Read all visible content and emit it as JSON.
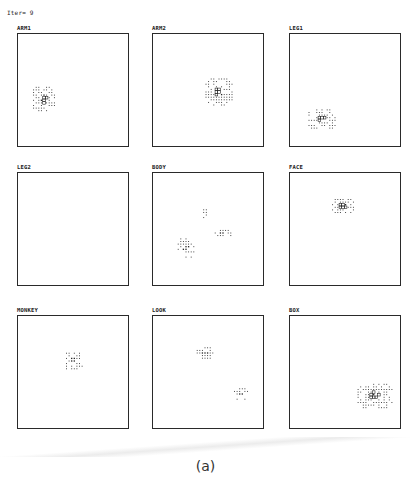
{
  "header": {
    "iteration_label": "Iter= 9"
  },
  "caption": "(a)",
  "colors": {
    "ink": "#222222",
    "border": "#2a2a2a",
    "background": "#ffffff"
  },
  "panels": [
    {
      "label": "ARM1",
      "clusters": [
        {
          "cx": 26,
          "cy": 65,
          "w": 9,
          "h": 10,
          "highlight": true
        }
      ]
    },
    {
      "label": "ARM2",
      "clusters": [
        {
          "cx": 66,
          "cy": 58,
          "w": 11,
          "h": 11,
          "highlight": true
        }
      ]
    },
    {
      "label": "LEG1",
      "clusters": [
        {
          "cx": 32,
          "cy": 85,
          "w": 11,
          "h": 8,
          "highlight": true
        }
      ]
    },
    {
      "label": "LEG2",
      "clusters": []
    },
    {
      "label": "BODY",
      "clusters": [
        {
          "cx": 52,
          "cy": 42,
          "w": 2,
          "h": 5,
          "highlight": false
        },
        {
          "cx": 70,
          "cy": 60,
          "w": 7,
          "h": 3,
          "highlight": false
        },
        {
          "cx": 33,
          "cy": 75,
          "w": 7,
          "h": 8,
          "highlight": false
        }
      ]
    },
    {
      "label": "FACE",
      "clusters": [
        {
          "cx": 53,
          "cy": 33,
          "w": 9,
          "h": 6,
          "highlight": true
        }
      ]
    },
    {
      "label": "MONKEY",
      "clusters": [
        {
          "cx": 55,
          "cy": 45,
          "w": 8,
          "h": 7,
          "highlight": false
        }
      ]
    },
    {
      "label": "LOOK",
      "clusters": [
        {
          "cx": 52,
          "cy": 37,
          "w": 7,
          "h": 5,
          "highlight": false
        },
        {
          "cx": 88,
          "cy": 78,
          "w": 6,
          "h": 5,
          "highlight": false
        }
      ]
    },
    {
      "label": "BOX",
      "clusters": [
        {
          "cx": 85,
          "cy": 80,
          "w": 14,
          "h": 10,
          "highlight": true
        }
      ]
    }
  ]
}
